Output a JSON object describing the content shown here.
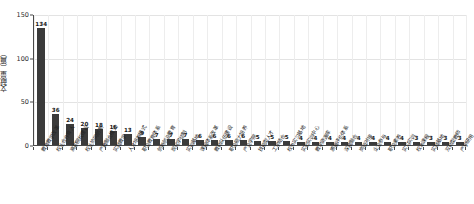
{
  "chart_data": {
    "type": "bar",
    "title": "",
    "xlabel": "",
    "ylabel": "文献量（篇）",
    "ylim": [
      0,
      150
    ],
    "yticks": [
      0,
      50,
      100,
      150
    ],
    "grid": true,
    "legend": "none",
    "bar_color": "#3b3b3b",
    "categories": [
      "教育教学改革",
      "校企合作育人",
      "高职院校建设",
      "校企协同创新",
      "产教融合模式",
      "实践教学",
      "人才培养模式",
      "职业教育体系",
      "创新创业教育",
      "现代学徒制",
      "实训基地",
      "课程体系改革",
      "教师队伍建设",
      "职业能力培养",
      "产业学院",
      "技能型人才",
      "工学结合",
      "校外实习基地",
      "实验实训中心",
      "教学资源库",
      "质量评价体系",
      "深度融合",
      "岗位对接",
      "企业参与",
      "职业素养",
      "实习实训",
      "校本课程",
      "实践基地",
      "双师型教师",
      "产学研用"
    ],
    "values": [
      134,
      36,
      24,
      20,
      18,
      16,
      13,
      9,
      7,
      7,
      7,
      6,
      6,
      6,
      6,
      5,
      5,
      5,
      4,
      4,
      4,
      4,
      4,
      4,
      4,
      4,
      3,
      3,
      3,
      3
    ]
  }
}
